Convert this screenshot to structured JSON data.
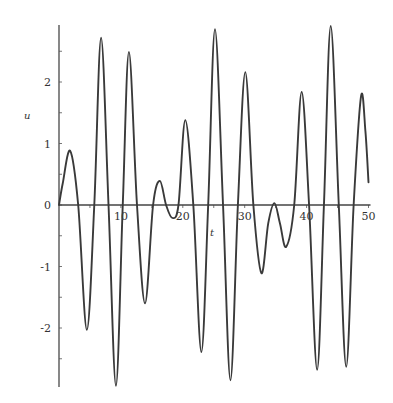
{
  "chart_data": {
    "type": "line",
    "title": "",
    "xlabel": "t",
    "ylabel": "u",
    "xlim": [
      0,
      50
    ],
    "ylim": [
      -2.95,
      2.95
    ],
    "grid": false,
    "legend": null,
    "x_ticks": [
      10,
      20,
      30,
      40,
      50
    ],
    "x_tick_labels": [
      "10",
      "20",
      "30",
      "40",
      "50"
    ],
    "y_ticks": [
      -2,
      -1,
      0,
      1,
      2
    ],
    "y_tick_labels": [
      "-2",
      "-1",
      "0",
      "1",
      "2"
    ],
    "line_color": "#3a3a3a",
    "series": [
      {
        "name": "u(t)",
        "x": [
          0,
          0.6,
          1.8,
          3.1,
          4.5,
          5.7,
          6.8,
          8.0,
          9.2,
          10.3,
          11.3,
          12.6,
          13.9,
          15.2,
          16.3,
          17.3,
          18.3,
          19.3,
          20.4,
          21.7,
          23.0,
          24.1,
          25.2,
          26.5,
          27.7,
          28.9,
          30.1,
          31.4,
          32.7,
          33.8,
          34.8,
          35.7,
          36.7,
          38.0,
          39.2,
          40.4,
          41.7,
          42.8,
          43.9,
          45.2,
          46.4,
          47.6,
          48.8,
          49.5,
          50.0
        ],
        "y": [
          0,
          0.35,
          0.88,
          0.0,
          -2.03,
          0.0,
          2.72,
          0.0,
          -2.94,
          0.0,
          2.49,
          0.0,
          -1.6,
          0.0,
          0.39,
          0.0,
          -0.21,
          0.0,
          1.38,
          0.0,
          -2.39,
          0.0,
          2.86,
          0.0,
          -2.85,
          0.0,
          2.16,
          0.0,
          -1.11,
          -0.3,
          0.03,
          -0.3,
          -0.68,
          0.0,
          1.84,
          0.0,
          -2.68,
          0.0,
          2.91,
          0.0,
          -2.63,
          0.0,
          1.77,
          1.2,
          0.37
        ]
      }
    ]
  }
}
